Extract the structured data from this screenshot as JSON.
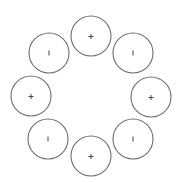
{
  "diagram": {
    "layout": "ring",
    "count": 8,
    "stroke_color": "#6e6e6e",
    "glyph_color": "#444444",
    "radius": 20,
    "nodes": [
      {
        "position": "top",
        "symbol": "plus",
        "label": "+",
        "cx": 91,
        "cy": 36
      },
      {
        "position": "top-right",
        "symbol": "bar",
        "label": "|",
        "cx": 133,
        "cy": 53
      },
      {
        "position": "right",
        "symbol": "plus",
        "label": "+",
        "cx": 151,
        "cy": 97
      },
      {
        "position": "bottom-right",
        "symbol": "bar",
        "label": "|",
        "cx": 133,
        "cy": 139
      },
      {
        "position": "bottom",
        "symbol": "plus",
        "label": "+",
        "cx": 91,
        "cy": 156
      },
      {
        "position": "bottom-left",
        "symbol": "bar",
        "label": "|",
        "cx": 48,
        "cy": 139
      },
      {
        "position": "left",
        "symbol": "plus",
        "label": "+",
        "cx": 31,
        "cy": 96
      },
      {
        "position": "top-left",
        "symbol": "bar",
        "label": "|",
        "cx": 49,
        "cy": 53
      }
    ]
  }
}
